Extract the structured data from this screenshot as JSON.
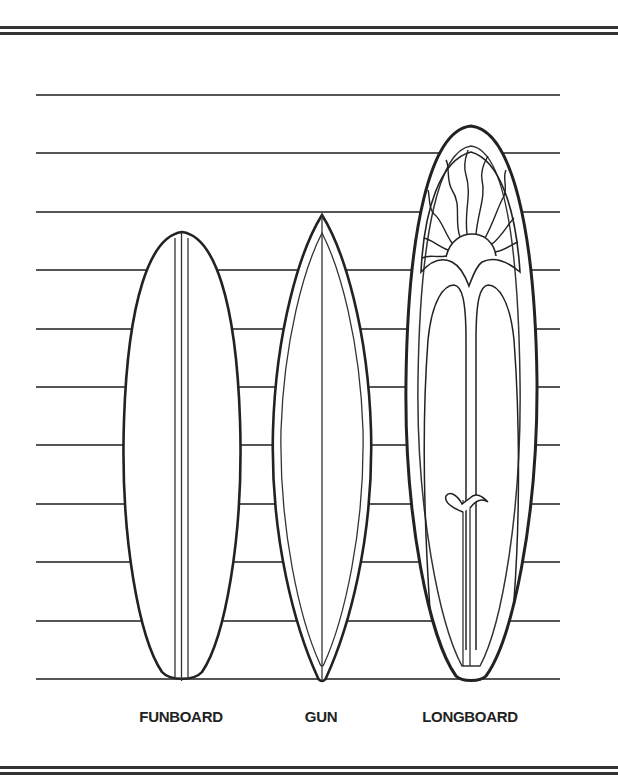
{
  "page": {
    "type": "coloring-page"
  },
  "header_text": "",
  "guide_lines_y": [
    94,
    152,
    211,
    269,
    328,
    386,
    444,
    503,
    561,
    620,
    678
  ],
  "boards": [
    {
      "id": "funboard",
      "label": "FUNBOARD",
      "center_x": 182,
      "top_y": 232,
      "bottom_y": 680,
      "half_width": 58,
      "stringers": 3
    },
    {
      "id": "gun",
      "label": "GUN",
      "center_x": 322,
      "top_y": 215,
      "bottom_y": 680,
      "half_width": 49,
      "stringers": 1
    },
    {
      "id": "longboard",
      "label": "LONGBOARD",
      "center_x": 471,
      "top_y": 126,
      "bottom_y": 680,
      "half_width": 67,
      "decoration": "sun with rays, double arches, fin"
    }
  ],
  "colors": {
    "outline": "#222222",
    "guide": "#555555",
    "rule": "#333333",
    "background": "#ffffff"
  }
}
